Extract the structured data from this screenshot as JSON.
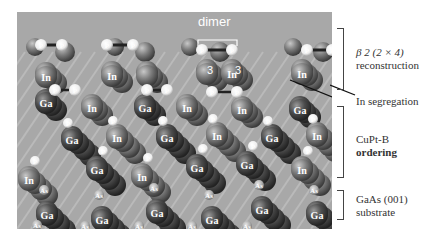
{
  "figure": {
    "dimer_label": "dimer",
    "annotations": [
      {
        "id": "reconstruction",
        "line1": "β 2 (2 × 4)",
        "line2": "reconstruction"
      },
      {
        "id": "segregation",
        "line1": "In segregation"
      },
      {
        "id": "ordering",
        "line1": "CuPt-B",
        "line2": "ordering"
      },
      {
        "id": "substrate",
        "line1": "GaAs (001)",
        "line2": "substrate"
      }
    ],
    "atom_labels": {
      "p": "P",
      "in": "In",
      "ga": "Ga",
      "as": "As"
    },
    "site_labels": [
      "3",
      "In",
      "3",
      "In",
      "A",
      "A",
      "B",
      "B",
      "Ga",
      "C",
      "D",
      "D",
      "In"
    ],
    "colors": {
      "background": "#a9a9a9",
      "in_atom": "#7a7a7a",
      "ga_atom": "#4a4a4a",
      "p_atom": "#f4f4f4",
      "as_atom": "#bdbdbd",
      "text": "#333333"
    }
  }
}
